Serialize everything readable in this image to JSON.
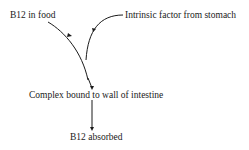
{
  "diagram": {
    "nodes": [
      {
        "id": "b12_food",
        "label": "B12 in food"
      },
      {
        "id": "intrinsic",
        "label": "Intrinsic factor from stomach"
      },
      {
        "id": "complex",
        "label": "Complex bound to wall of intestine"
      },
      {
        "id": "absorbed",
        "label": "B12 absorbed"
      }
    ],
    "edges": [
      {
        "from": "b12_food",
        "to": "complex"
      },
      {
        "from": "intrinsic",
        "to": "complex"
      },
      {
        "from": "complex",
        "to": "absorbed"
      }
    ],
    "colors": {
      "line": "#1a1a1a",
      "background": "#ffffff"
    }
  }
}
